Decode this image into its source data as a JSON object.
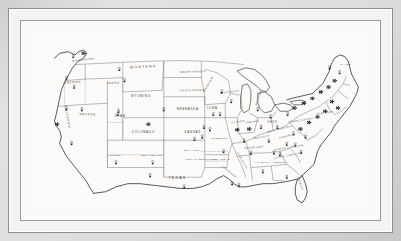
{
  "figure": {
    "kind": "map",
    "title_visible": "",
    "frame": {
      "style": "double-rule",
      "mat_color": "#d9d9d9",
      "plate_color": "#fcfbf9",
      "rule_color": "#8d8d8d"
    },
    "colors": {
      "ink": "#2b2b2b",
      "label": "#3a3a3a",
      "state_border": "#5d5d5d",
      "dashed_border": "#6b6b6b",
      "symbol": "#222222"
    }
  },
  "map": {
    "region": "Contiguous United States",
    "era_note": "INDIAN TERRITORY shown separately from OKLAHOMA",
    "state_labels": [
      {
        "name": "WASHINGTON",
        "x": 58,
        "y": 33,
        "size": "sm",
        "rotate": -6
      },
      {
        "name": "OREGON",
        "x": 45,
        "y": 61,
        "size": "md",
        "rotate": -4
      },
      {
        "name": "IDAHO",
        "x": 93,
        "y": 62,
        "size": "md",
        "rotate": -2
      },
      {
        "name": "MONTANA",
        "x": 128,
        "y": 42,
        "size": "lg",
        "rotate": -3
      },
      {
        "name": "NORTH DAKOTA",
        "x": 186,
        "y": 48,
        "size": "sm",
        "rotate": -2
      },
      {
        "name": "SOUTH DAKOTA",
        "x": 186,
        "y": 71,
        "size": "sm",
        "rotate": -1
      },
      {
        "name": "WYOMING",
        "x": 125,
        "y": 78,
        "size": "md",
        "rotate": 0
      },
      {
        "name": "NEVADA",
        "x": 63,
        "y": 101,
        "size": "md",
        "rotate": 2
      },
      {
        "name": "UTAH",
        "x": 101,
        "y": 103,
        "size": "md",
        "rotate": 0
      },
      {
        "name": "CALIFORNIA",
        "x": 38,
        "y": 103,
        "size": "md",
        "rotate": 80
      },
      {
        "name": "COLORADO",
        "x": 128,
        "y": 123,
        "size": "md",
        "rotate": 0
      },
      {
        "name": "NEBRASKA",
        "x": 180,
        "y": 94,
        "size": "md",
        "rotate": 0
      },
      {
        "name": "KANSAS",
        "x": 186,
        "y": 123,
        "size": "md",
        "rotate": 0
      },
      {
        "name": "ARIZONA",
        "x": 95,
        "y": 152,
        "size": "sm",
        "rotate": 0
      },
      {
        "name": "NEW MEXICO",
        "x": 138,
        "y": 152,
        "size": "sm",
        "rotate": 0
      },
      {
        "name": "TEXAS",
        "x": 168,
        "y": 180,
        "size": "lg",
        "rotate": 0
      },
      {
        "name": "OKLAHOMA",
        "x": 186,
        "y": 146,
        "size": "sm",
        "rotate": 0
      },
      {
        "name": "INDIAN TERRITORY",
        "x": 196,
        "y": 157,
        "size": "sm",
        "rotate": 0
      },
      {
        "name": "ARKANSAS",
        "x": 219,
        "y": 157,
        "size": "sm",
        "rotate": 0
      },
      {
        "name": "MISSOURI",
        "x": 218,
        "y": 131,
        "size": "sm",
        "rotate": 0
      },
      {
        "name": "IOWA",
        "x": 209,
        "y": 93,
        "size": "md",
        "rotate": 0
      },
      {
        "name": "MINNESOTA",
        "x": 205,
        "y": 63,
        "size": "sm",
        "rotate": -62
      },
      {
        "name": "WISCONSIN",
        "x": 229,
        "y": 73,
        "size": "sm",
        "rotate": -8
      },
      {
        "name": "MICHIGAN",
        "x": 264,
        "y": 79,
        "size": "sm",
        "rotate": -72
      },
      {
        "name": "ILLINOIS",
        "x": 239,
        "y": 110,
        "size": "sm",
        "rotate": -8
      },
      {
        "name": "INDIANA",
        "x": 256,
        "y": 110,
        "size": "sm",
        "rotate": -8
      },
      {
        "name": "OHIO",
        "x": 279,
        "y": 111,
        "size": "md",
        "rotate": 0
      },
      {
        "name": "KENTUCKY",
        "x": 267,
        "y": 129,
        "size": "sm",
        "rotate": -10
      },
      {
        "name": "TENNESSEE",
        "x": 258,
        "y": 142,
        "size": "sm",
        "rotate": -6
      },
      {
        "name": "VIRGINIA",
        "x": 296,
        "y": 128,
        "size": "sm",
        "rotate": -14
      },
      {
        "name": "NORTH CAROLINA",
        "x": 299,
        "y": 142,
        "size": "sm",
        "rotate": -10
      },
      {
        "name": "SOUTH CAROLINA",
        "x": 298,
        "y": 152,
        "size": "sm",
        "rotate": -12
      },
      {
        "name": "GEORGIA",
        "x": 289,
        "y": 160,
        "size": "sm",
        "rotate": 0
      },
      {
        "name": "ALABAMA",
        "x": 268,
        "y": 160,
        "size": "sm",
        "rotate": 0
      },
      {
        "name": "MISSISSIPPI",
        "x": 243,
        "y": 158,
        "size": "sm",
        "rotate": 62
      },
      {
        "name": "LOUISIANA",
        "x": 228,
        "y": 172,
        "size": "sm",
        "rotate": 40
      },
      {
        "name": "FLORIDA",
        "x": 311,
        "y": 186,
        "size": "sm",
        "rotate": 72
      },
      {
        "name": "NEW YORK",
        "x": 341,
        "y": 99,
        "size": "sm",
        "rotate": -8
      },
      {
        "name": "PENNSYLVANIA",
        "x": 313,
        "y": 108,
        "size": "sm",
        "rotate": -10
      },
      {
        "name": "MAINE",
        "x": 365,
        "y": 39,
        "size": "sm",
        "rotate": 0
      },
      {
        "name": "WEST VIRGINIA",
        "x": 288,
        "y": 119,
        "size": "sm",
        "rotate": -16
      }
    ],
    "symbols": {
      "description": "Small point markers (circles, squares and composite glyphs) marking locations across the country; density is highest in the Northeast corridor.",
      "points": [
        {
          "x": 58,
          "y": 24,
          "type": "cluster"
        },
        {
          "x": 46,
          "y": 28,
          "type": "mark"
        },
        {
          "x": 38,
          "y": 55,
          "type": "mark"
        },
        {
          "x": 47,
          "y": 66,
          "type": "mark"
        },
        {
          "x": 27,
          "y": 112,
          "type": "cluster"
        },
        {
          "x": 38,
          "y": 93,
          "type": "mark"
        },
        {
          "x": 56,
          "y": 94,
          "type": "mark"
        },
        {
          "x": 44,
          "y": 136,
          "type": "mark"
        },
        {
          "x": 106,
          "y": 58,
          "type": "mark"
        },
        {
          "x": 100,
          "y": 44,
          "type": "mark"
        },
        {
          "x": 99,
          "y": 96,
          "type": "mark"
        },
        {
          "x": 98,
          "y": 100,
          "type": "mark"
        },
        {
          "x": 134,
          "y": 112,
          "type": "cluster"
        },
        {
          "x": 152,
          "y": 94,
          "type": "mark"
        },
        {
          "x": 96,
          "y": 160,
          "type": "mark"
        },
        {
          "x": 139,
          "y": 160,
          "type": "mark"
        },
        {
          "x": 136,
          "y": 176,
          "type": "mark"
        },
        {
          "x": 176,
          "y": 190,
          "type": "mark"
        },
        {
          "x": 199,
          "y": 116,
          "type": "mark"
        },
        {
          "x": 206,
          "y": 119,
          "type": "mark"
        },
        {
          "x": 197,
          "y": 128,
          "type": "mark"
        },
        {
          "x": 188,
          "y": 131,
          "type": "mark"
        },
        {
          "x": 210,
          "y": 100,
          "type": "mark"
        },
        {
          "x": 218,
          "y": 100,
          "type": "mark"
        },
        {
          "x": 231,
          "y": 84,
          "type": "mark"
        },
        {
          "x": 220,
          "y": 72,
          "type": "mark"
        },
        {
          "x": 238,
          "y": 119,
          "type": "cluster"
        },
        {
          "x": 252,
          "y": 118,
          "type": "cluster"
        },
        {
          "x": 266,
          "y": 116,
          "type": "mark"
        },
        {
          "x": 262,
          "y": 94,
          "type": "mark"
        },
        {
          "x": 277,
          "y": 103,
          "type": "mark"
        },
        {
          "x": 285,
          "y": 116,
          "type": "mark"
        },
        {
          "x": 297,
          "y": 100,
          "type": "mark"
        },
        {
          "x": 305,
          "y": 92,
          "type": "cluster"
        },
        {
          "x": 316,
          "y": 86,
          "type": "cluster"
        },
        {
          "x": 326,
          "y": 80,
          "type": "cluster"
        },
        {
          "x": 336,
          "y": 72,
          "type": "cluster"
        },
        {
          "x": 345,
          "y": 66,
          "type": "cluster"
        },
        {
          "x": 352,
          "y": 58,
          "type": "cluster"
        },
        {
          "x": 349,
          "y": 84,
          "type": "cluster"
        },
        {
          "x": 356,
          "y": 92,
          "type": "cluster"
        },
        {
          "x": 341,
          "y": 96,
          "type": "cluster"
        },
        {
          "x": 332,
          "y": 103,
          "type": "cluster"
        },
        {
          "x": 322,
          "y": 110,
          "type": "cluster"
        },
        {
          "x": 312,
          "y": 118,
          "type": "cluster"
        },
        {
          "x": 304,
          "y": 124,
          "type": "mark"
        },
        {
          "x": 318,
          "y": 128,
          "type": "mark"
        },
        {
          "x": 296,
          "y": 137,
          "type": "mark"
        },
        {
          "x": 306,
          "y": 138,
          "type": "mark"
        },
        {
          "x": 313,
          "y": 147,
          "type": "mark"
        },
        {
          "x": 288,
          "y": 150,
          "type": "mark"
        },
        {
          "x": 281,
          "y": 148,
          "type": "mark"
        },
        {
          "x": 268,
          "y": 171,
          "type": "mark"
        },
        {
          "x": 296,
          "y": 178,
          "type": "mark"
        },
        {
          "x": 232,
          "y": 186,
          "type": "mark"
        },
        {
          "x": 240,
          "y": 188,
          "type": "mark"
        },
        {
          "x": 222,
          "y": 146,
          "type": "mark"
        },
        {
          "x": 246,
          "y": 133,
          "type": "mark"
        },
        {
          "x": 275,
          "y": 133,
          "type": "mark"
        },
        {
          "x": 254,
          "y": 148,
          "type": "mark"
        },
        {
          "x": 346,
          "y": 42,
          "type": "mark"
        },
        {
          "x": 358,
          "y": 48,
          "type": "mark"
        }
      ]
    }
  }
}
